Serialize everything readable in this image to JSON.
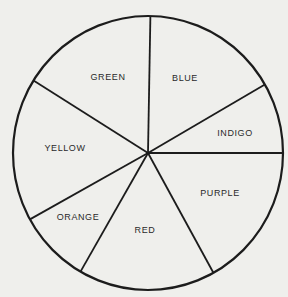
{
  "chart_data": {
    "type": "pie",
    "title": "",
    "start_angle_deg": -89,
    "direction": "clockwise",
    "slices": [
      {
        "label": "BLUE",
        "degrees": 59,
        "value": 16.4
      },
      {
        "label": "INDIGO",
        "degrees": 30,
        "value": 8.3
      },
      {
        "label": "PURPLE",
        "degrees": 61,
        "value": 16.9
      },
      {
        "label": "RED",
        "degrees": 59,
        "value": 16.4
      },
      {
        "label": "ORANGE",
        "degrees": 31,
        "value": 8.6
      },
      {
        "label": "YELLOW",
        "degrees": 61,
        "value": 16.9
      },
      {
        "label": "GREEN",
        "degrees": 59,
        "value": 16.4
      }
    ],
    "legend": "none (labels inside slices)",
    "fill": "none (outline only)"
  },
  "style": {
    "background": "#efefec",
    "stroke": "#1c1c1c",
    "text": "#2a2a2a"
  },
  "geometry": {
    "cx": 148,
    "cy": 153,
    "rx": 135,
    "ry": 137
  },
  "labels": [
    {
      "text": "GREEN",
      "x": 108,
      "y": 80
    },
    {
      "text": "BLUE",
      "x": 185,
      "y": 81
    },
    {
      "text": "INDIGO",
      "x": 235,
      "y": 136
    },
    {
      "text": "YELLOW",
      "x": 65,
      "y": 151
    },
    {
      "text": "PURPLE",
      "x": 220,
      "y": 196
    },
    {
      "text": "ORANGE",
      "x": 78,
      "y": 220
    },
    {
      "text": "RED",
      "x": 145,
      "y": 233
    }
  ]
}
